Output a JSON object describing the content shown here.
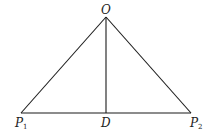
{
  "diagram": {
    "type": "triangle-with-altitude",
    "points": {
      "O": {
        "label": "O",
        "x": 106,
        "y": 17
      },
      "P1": {
        "label": "P",
        "subscript": "1",
        "x": 21,
        "y": 113
      },
      "P2": {
        "label": "P",
        "subscript": "2",
        "x": 191,
        "y": 113
      },
      "D": {
        "label": "D",
        "x": 106,
        "y": 113
      }
    },
    "segments": [
      {
        "from": "O",
        "to": "P1"
      },
      {
        "from": "O",
        "to": "P2"
      },
      {
        "from": "P1",
        "to": "P2"
      },
      {
        "from": "O",
        "to": "D"
      }
    ],
    "colors": {
      "line": "#1a1a1a",
      "text": "#222222",
      "background": "#ffffff"
    }
  }
}
